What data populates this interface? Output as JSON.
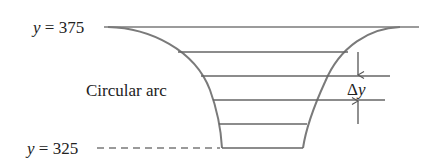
{
  "labels": {
    "top_level_prefix": "y",
    "top_level_eq": " = ",
    "top_level_value": "375",
    "bottom_level_prefix": "y",
    "bottom_level_eq": " = ",
    "bottom_level_value": "325",
    "arc_label": "Circular arc",
    "delta_symbol": "Δ",
    "delta_var": "y"
  },
  "colors": {
    "line": "#7a7a7a",
    "text": "#222222"
  },
  "levels": {
    "top_y": 375,
    "bottom_y": 325,
    "slice_count": 5
  }
}
